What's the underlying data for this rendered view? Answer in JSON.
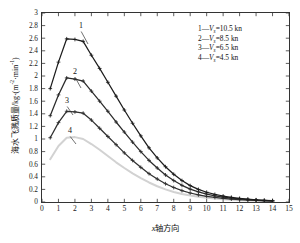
{
  "chart_data": {
    "type": "line",
    "title": "",
    "xlabel": "x轴方向",
    "ylabel": "海水飞溅质量/kg·(m⁻²·min⁻¹)",
    "xlim": [
      0,
      15
    ],
    "ylim": [
      0,
      3
    ],
    "xticks": [
      "0",
      "1",
      "2",
      "3",
      "4",
      "5",
      "6",
      "7",
      "8",
      "9",
      "10",
      "11",
      "12",
      "13",
      "14",
      "15"
    ],
    "yticks": [
      "0",
      "0.2",
      "0.4",
      "0.6",
      "0.8",
      "1",
      "1.2",
      "1.4",
      "1.6",
      "1.8",
      "2",
      "2.2",
      "2.4",
      "2.6",
      "2.8",
      "3"
    ],
    "grid": false,
    "legend_position": "top-right",
    "x": [
      0.5,
      1,
      1.5,
      2,
      2.5,
      3,
      3.5,
      4,
      4.5,
      5,
      5.5,
      6,
      6.5,
      7,
      7.5,
      8,
      8.5,
      9,
      9.5,
      10,
      10.5,
      11,
      11.5,
      12,
      12.5,
      13,
      13.5,
      14
    ],
    "series": [
      {
        "name": "1",
        "label": "1—Vs=10.5 kn",
        "legend_index": "1",
        "legend_symbol": "V",
        "legend_subscript": "s",
        "legend_value": "10.5",
        "legend_unit": "kn",
        "color": "#1c1c1c",
        "marker": "plus",
        "values": [
          1.8,
          2.22,
          2.59,
          2.58,
          2.55,
          2.33,
          2.12,
          1.9,
          1.68,
          1.46,
          1.25,
          1.05,
          0.86,
          0.7,
          0.56,
          0.44,
          0.34,
          0.26,
          0.2,
          0.155,
          0.12,
          0.095,
          0.075,
          0.058,
          0.045,
          0.035,
          0.027,
          0.021
        ]
      },
      {
        "name": "2",
        "label": "2—Vs=8.5 kn",
        "legend_index": "2",
        "legend_symbol": "V",
        "legend_subscript": "s",
        "legend_value": "8.5",
        "legend_unit": "kn",
        "color": "#2a2a2a",
        "marker": "plus",
        "values": [
          1.37,
          1.7,
          1.97,
          1.95,
          1.92,
          1.76,
          1.6,
          1.44,
          1.27,
          1.11,
          0.95,
          0.8,
          0.66,
          0.54,
          0.43,
          0.34,
          0.265,
          0.205,
          0.16,
          0.125,
          0.098,
          0.078,
          0.062,
          0.049,
          0.039,
          0.031,
          0.024,
          0.019
        ]
      },
      {
        "name": "3",
        "label": "3—Vs=6.5 kn",
        "legend_index": "3",
        "legend_symbol": "V",
        "legend_subscript": "s",
        "legend_value": "6.5",
        "legend_unit": "kn",
        "color": "#2f2f2f",
        "marker": "plus",
        "values": [
          1.02,
          1.26,
          1.44,
          1.43,
          1.41,
          1.3,
          1.17,
          1.04,
          0.91,
          0.78,
          0.66,
          0.55,
          0.45,
          0.365,
          0.29,
          0.23,
          0.18,
          0.143,
          0.113,
          0.09,
          0.072,
          0.058,
          0.046,
          0.037,
          0.03,
          0.024,
          0.019,
          0.015
        ]
      },
      {
        "name": "4",
        "label": "4—Vs=4.5 kn",
        "legend_index": "4",
        "legend_symbol": "V",
        "legend_subscript": "s",
        "legend_value": "4.5",
        "legend_unit": "kn",
        "color": "#d2d2d2",
        "marker": "none",
        "values": [
          0.68,
          0.89,
          1.02,
          1.03,
          1.0,
          0.92,
          0.83,
          0.73,
          0.63,
          0.54,
          0.455,
          0.38,
          0.31,
          0.25,
          0.2,
          0.16,
          0.128,
          0.103,
          0.083,
          0.067,
          0.054,
          0.044,
          0.036,
          0.029,
          0.024,
          0.02,
          0.016,
          0.013
        ]
      }
    ],
    "annotations": [
      {
        "text": "1",
        "x_px": 79,
        "y_px": 22,
        "leader_to_x": 88,
        "leader_to_y": 44
      },
      {
        "text": "2",
        "x_px": 73,
        "y_px": 68,
        "leader_to_x": 81,
        "leader_to_y": 88
      },
      {
        "text": "3",
        "x_px": 65,
        "y_px": 97,
        "leader_to_x": 73,
        "leader_to_y": 115
      },
      {
        "text": "4",
        "x_px": 68,
        "y_px": 127,
        "leader_to_x": 76,
        "leader_to_y": 144
      }
    ]
  },
  "legend": {
    "entries": [
      {
        "index": "1",
        "sym": "V",
        "sub": "s",
        "eq": "=10.5 kn"
      },
      {
        "index": "2",
        "sym": "V",
        "sub": "s",
        "eq": "=8.5 kn"
      },
      {
        "index": "3",
        "sym": "V",
        "sub": "s",
        "eq": "=6.5 kn"
      },
      {
        "index": "4",
        "sym": "V",
        "sub": "s",
        "eq": "=4.5 kn"
      }
    ]
  },
  "axes": {
    "y_title_zh": "海水飞溅质量",
    "y_title_unit_pre": "/kg·(m",
    "y_title_unit_sup1": "-2",
    "y_title_unit_mid": "·min",
    "y_title_unit_sup2": "-1",
    "y_title_unit_post": ")",
    "x_title_it": "x",
    "x_title_zh": "轴方向"
  }
}
